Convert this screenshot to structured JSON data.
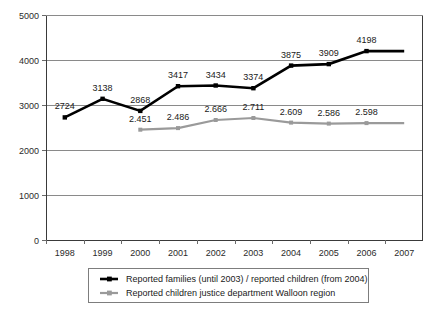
{
  "chart_data": {
    "type": "line",
    "title": "",
    "xlabel": "",
    "ylabel": "",
    "categories": [
      "1998",
      "1999",
      "2000",
      "2001",
      "2002",
      "2003",
      "2004",
      "2005",
      "2006",
      "2007"
    ],
    "ylim": [
      0,
      5000
    ],
    "yticks": [
      0,
      1000,
      2000,
      3000,
      4000,
      5000
    ],
    "ytick_labels": [
      "0",
      "1000",
      "2000",
      "3000",
      "4000",
      "5000"
    ],
    "grid": true,
    "legend_position": "bottom",
    "series": [
      {
        "name": "Reported families (until 2003) / reported children (from 2004)",
        "color": "#000000",
        "marker": "square",
        "values": [
          2724,
          3138,
          2868,
          3417,
          3434,
          3374,
          3875,
          3909,
          4198,
          4198
        ],
        "point_labels": [
          "2724",
          "3138",
          "2868",
          "3417",
          "3434",
          "3374",
          "3875",
          "3909",
          "4198",
          ""
        ]
      },
      {
        "name": "Reported children justice department Walloon region",
        "color": "#9a9a9a",
        "marker": "square",
        "values": [
          null,
          null,
          2451,
          2486,
          2666,
          2711,
          2609,
          2586,
          2598,
          2598
        ],
        "point_labels": [
          "",
          "",
          "2.451",
          "2.486",
          "2.666",
          "2.711",
          "2.609",
          "2.586",
          "2.598",
          ""
        ]
      }
    ]
  },
  "legend": {
    "entries": [
      {
        "label": "Reported families (until 2003) / reported children (from 2004)",
        "color": "#000000"
      },
      {
        "label": "Reported children justice department Walloon region",
        "color": "#9a9a9a"
      }
    ]
  }
}
